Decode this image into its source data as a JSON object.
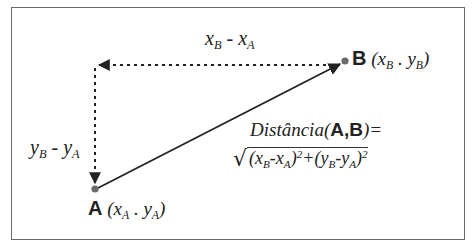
{
  "diagram": {
    "colors": {
      "line": "#222222",
      "point": "#6b6b6b",
      "frame": "#6a6a6a",
      "background": "#ffffff"
    },
    "points": {
      "A": {
        "label": "A",
        "coords_text_open": "(",
        "x": "x",
        "x_sub": "A",
        "sep": " . ",
        "y": "y",
        "y_sub": "A",
        "coords_text_close": ")",
        "px": [
          95,
          189
        ]
      },
      "B": {
        "label": "B",
        "coords_text_open": "(",
        "x": "x",
        "x_sub": "B",
        "sep": " . ",
        "y": "y",
        "y_sub": "B",
        "coords_text_close": ")",
        "px": [
          345,
          61
        ]
      },
      "corner": {
        "px": [
          95,
          65
        ]
      }
    },
    "labels": {
      "dx": {
        "a": "x",
        "a_sub": "B",
        "op": " - ",
        "b": "x",
        "b_sub": "A"
      },
      "dy": {
        "a": "y",
        "a_sub": "B",
        "op": " - ",
        "b": "y",
        "b_sub": "A"
      }
    },
    "formula": {
      "lhs_prefix": "Distância(",
      "pointA": "A",
      "comma": ",",
      "pointB": "B",
      "lhs_suffix": ")=",
      "radical": "√",
      "term1_open": "(",
      "term1_a": "x",
      "term1_a_sub": "B",
      "term1_op": "-",
      "term1_b": "x",
      "term1_b_sub": "A",
      "term1_close": ")",
      "exp1": "2",
      "plus": "+",
      "term2_open": "(",
      "term2_a": "y",
      "term2_a_sub": "B",
      "term2_op": "-",
      "term2_b": "y",
      "term2_b_sub": "A",
      "term2_close": ")",
      "exp2": "2"
    }
  }
}
